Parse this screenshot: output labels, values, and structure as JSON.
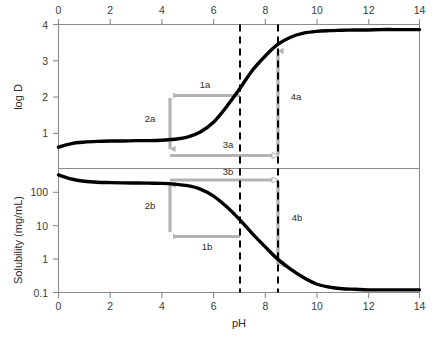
{
  "figure": {
    "background_color": "#ffffff",
    "curve_color": "#000000",
    "axis_color": "#888888",
    "annotation_color": "#b3b3b3",
    "dashed_line_color": "#000000"
  },
  "axes": {
    "x": {
      "label": "pH",
      "ticks": [
        "0",
        "2",
        "4",
        "6",
        "8",
        "10",
        "12",
        "14"
      ],
      "tick_values": [
        0,
        2,
        4,
        6,
        8,
        10,
        12,
        14
      ],
      "range": [
        0,
        14
      ],
      "top_axis_shown": true,
      "bottom_axis_shown": true
    },
    "y_top": {
      "label": "log D",
      "ticks": [
        "1",
        "2",
        "3",
        "4"
      ],
      "tick_values": [
        1,
        2,
        3,
        4
      ],
      "range": [
        0.3,
        4
      ]
    },
    "y_bottom": {
      "label": "Solubility (mg/mL)",
      "ticks": [
        "100",
        "10",
        "1",
        "0.1"
      ],
      "tick_values": [
        100,
        10,
        1,
        0.1
      ],
      "scale": "log",
      "range": [
        0.1,
        400
      ]
    }
  },
  "markers": {
    "dashed_lines": [
      {
        "name": "pH-7",
        "value": 7.0
      },
      {
        "name": "pH-8.4",
        "value": 8.4
      }
    ]
  },
  "annotations": {
    "top_panel": [
      {
        "id": "1a",
        "label": "1a",
        "type": "horizontal-arrow-left"
      },
      {
        "id": "2a",
        "label": "2a",
        "type": "vertical-arrow-down"
      },
      {
        "id": "3a",
        "label": "3a",
        "type": "horizontal-arrow-right"
      },
      {
        "id": "4a",
        "label": "4a",
        "type": "vertical-arrow-up"
      }
    ],
    "bottom_panel": [
      {
        "id": "1b",
        "label": "1b",
        "type": "horizontal-arrow-left"
      },
      {
        "id": "2b",
        "label": "2b",
        "type": "vertical-arrow-up"
      },
      {
        "id": "3b",
        "label": "3b",
        "type": "horizontal-arrow-right"
      },
      {
        "id": "4b",
        "label": "4b",
        "type": "vertical-arrow-down"
      }
    ]
  },
  "chart_data": {
    "type": "line",
    "title": "",
    "xlabel": "pH",
    "grid": false,
    "legend": null,
    "panels": [
      {
        "name": "log-D-panel",
        "ylabel": "log D",
        "yscale": "linear",
        "ylim": [
          0.3,
          4.0
        ],
        "ytick_labels": [
          "1",
          "2",
          "3",
          "4"
        ],
        "xlim": [
          0,
          14
        ],
        "xtick_labels": [
          "0",
          "2",
          "4",
          "6",
          "8",
          "10",
          "12",
          "14"
        ],
        "series": [
          {
            "name": "log D vs pH",
            "x": [
              0,
              0.5,
              1,
              1.5,
              2,
              2.5,
              3,
              3.5,
              4,
              4.5,
              5,
              5.5,
              6,
              6.5,
              7,
              7.5,
              8,
              8.5,
              9,
              9.5,
              10,
              10.5,
              11,
              11.5,
              12,
              12.5,
              13,
              13.5,
              14
            ],
            "y": [
              0.62,
              0.72,
              0.76,
              0.78,
              0.79,
              0.79,
              0.8,
              0.8,
              0.81,
              0.84,
              0.9,
              1.04,
              1.3,
              1.72,
              2.2,
              2.72,
              3.12,
              3.45,
              3.65,
              3.76,
              3.81,
              3.83,
              3.84,
              3.85,
              3.85,
              3.86,
              3.86,
              3.86,
              3.86
            ]
          }
        ],
        "reference_lines": [
          7.0,
          8.4
        ],
        "annotation_points": {
          "plateau_logD": 0.8,
          "logD_at_pH7": 2.2,
          "logD_at_pH8.4": 3.4
        }
      },
      {
        "name": "solubility-panel",
        "ylabel": "Solubility (mg/mL)",
        "yscale": "log",
        "ylim": [
          0.1,
          400
        ],
        "ytick_labels": [
          "100",
          "10",
          "1",
          "0.1"
        ],
        "xlim": [
          0,
          14
        ],
        "xtick_labels": [
          "0",
          "2",
          "4",
          "6",
          "8",
          "10",
          "12",
          "14"
        ],
        "series": [
          {
            "name": "Solubility vs pH",
            "x": [
              0,
              0.5,
              1,
              1.5,
              2,
              2.5,
              3,
              3.5,
              4,
              4.5,
              5,
              5.5,
              6,
              6.5,
              7,
              7.5,
              8,
              8.5,
              9,
              9.5,
              10,
              10.5,
              11,
              11.5,
              12,
              12.5,
              13,
              13.5,
              14
            ],
            "y": [
              330,
              250,
              215,
              200,
              195,
              192,
              190,
              188,
              185,
              175,
              158,
              125,
              78,
              38,
              16,
              6.0,
              2.4,
              1.0,
              0.5,
              0.28,
              0.18,
              0.145,
              0.13,
              0.125,
              0.12,
              0.12,
              0.12,
              0.12,
              0.12
            ]
          }
        ],
        "reference_lines": [
          7.0,
          8.4
        ],
        "annotation_points": {
          "plateau_solubility": 190,
          "solubility_at_pH7": 16,
          "solubility_at_pH8.4": 1.2
        }
      }
    ]
  }
}
